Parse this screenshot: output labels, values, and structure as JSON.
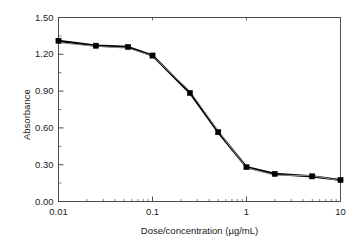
{
  "chart_data": {
    "type": "line",
    "title": "",
    "xlabel": "Dose/concentration (µg/mL)",
    "ylabel": "Absorbance",
    "xscale": "log",
    "yscale": "linear",
    "xlim": [
      0.01,
      10
    ],
    "ylim": [
      0.0,
      1.5
    ],
    "grid": false,
    "legend": "none",
    "xticks": [
      0.01,
      0.1,
      1,
      10
    ],
    "xtick_labels": [
      "0.01",
      "0.1",
      "1",
      "10"
    ],
    "yticks": [
      0.0,
      0.3,
      0.6,
      0.9,
      1.2,
      1.5
    ],
    "ytick_labels": [
      "0.00",
      "0.30",
      "0.60",
      "0.90",
      "1.20",
      "1.50"
    ],
    "minor_ticks": true,
    "series": [
      {
        "name": "sample",
        "color": "#000000",
        "marker": "square",
        "linewidth": 2.2,
        "x": [
          0.01,
          0.025,
          0.055,
          0.1,
          0.25,
          0.5,
          1.0,
          2.0,
          5.0,
          10.0
        ],
        "y": [
          1.31,
          1.27,
          1.26,
          1.19,
          0.885,
          0.565,
          0.28,
          0.225,
          0.205,
          0.175
        ]
      },
      {
        "name": "reference",
        "color": "#8c8c8c",
        "marker": "none",
        "linewidth": 1.0,
        "x": [
          0.01,
          0.025,
          0.055,
          0.1,
          0.25,
          0.5,
          1.0,
          2.0,
          5.0,
          10.0
        ],
        "y": [
          1.295,
          1.265,
          1.25,
          1.185,
          0.9,
          0.575,
          0.275,
          0.215,
          0.21,
          0.17
        ]
      }
    ]
  },
  "axes": {
    "frame_color": "#4d4d4d",
    "text_color": "#1a1a1a"
  }
}
